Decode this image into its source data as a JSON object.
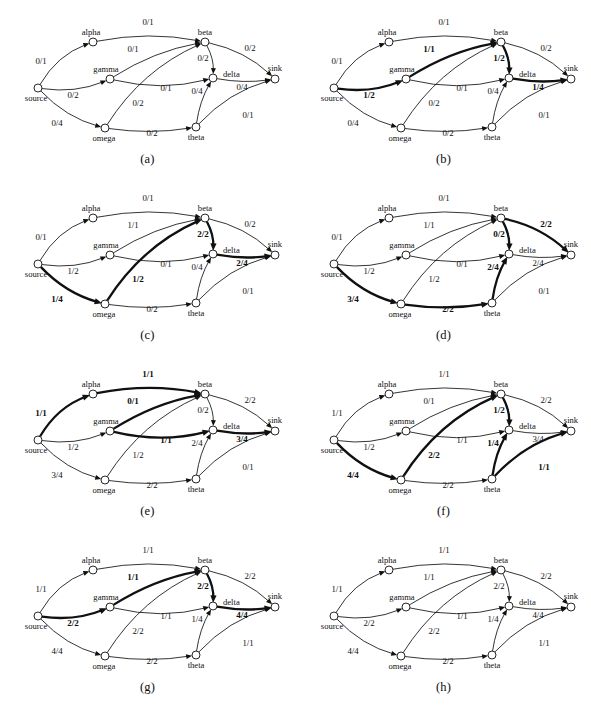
{
  "figure": {
    "kind": "max-flow-augmenting-path-sequence",
    "panel_count": 8
  },
  "nodes": [
    {
      "id": "source",
      "label": "source",
      "x": 38,
      "y": 88,
      "label_dx": -2,
      "label_dy": 13,
      "anchor": "middle"
    },
    {
      "id": "alpha",
      "label": "alpha",
      "x": 93,
      "y": 42,
      "label_dx": -2,
      "label_dy": -7,
      "anchor": "middle"
    },
    {
      "id": "gamma",
      "label": "gamma",
      "x": 110,
      "y": 79,
      "label_dx": -4,
      "label_dy": -7,
      "anchor": "middle"
    },
    {
      "id": "omega",
      "label": "omega",
      "x": 105,
      "y": 128,
      "label_dx": -1,
      "label_dy": 13,
      "anchor": "middle"
    },
    {
      "id": "beta",
      "label": "beta",
      "x": 205,
      "y": 42,
      "label_dx": 0,
      "label_dy": -7,
      "anchor": "middle"
    },
    {
      "id": "delta",
      "label": "delta",
      "x": 213,
      "y": 78,
      "label_dx": 10,
      "label_dy": -1,
      "anchor": "start"
    },
    {
      "id": "theta",
      "label": "theta",
      "x": 196,
      "y": 127,
      "label_dx": 0,
      "label_dy": 13,
      "anchor": "middle"
    },
    {
      "id": "sink",
      "label": "sink",
      "x": 275,
      "y": 79,
      "label_dx": 0,
      "label_dy": -8,
      "anchor": "middle"
    }
  ],
  "edges": [
    {
      "id": "source-alpha",
      "from": "source",
      "to": "alpha",
      "label_x": 41,
      "label_y": 64
    },
    {
      "id": "source-gamma",
      "from": "source",
      "to": "gamma",
      "label_x": 73,
      "label_y": 98
    },
    {
      "id": "source-omega",
      "from": "source",
      "to": "omega",
      "label_x": 57,
      "label_y": 126
    },
    {
      "id": "alpha-beta",
      "from": "alpha",
      "to": "beta",
      "label_x": 148,
      "label_y": 25
    },
    {
      "id": "gamma-beta",
      "from": "gamma",
      "to": "beta",
      "label_x": 133,
      "label_y": 52
    },
    {
      "id": "gamma-delta",
      "from": "gamma",
      "to": "delta",
      "label_x": 166,
      "label_y": 91
    },
    {
      "id": "omega-beta",
      "from": "omega",
      "to": "beta",
      "label_x": 138,
      "label_y": 106
    },
    {
      "id": "omega-theta",
      "from": "omega",
      "to": "theta",
      "label_x": 152,
      "label_y": 136
    },
    {
      "id": "beta-delta",
      "from": "beta",
      "to": "delta",
      "label_x": 203,
      "label_y": 61
    },
    {
      "id": "beta-sink",
      "from": "beta",
      "to": "sink",
      "label_x": 250,
      "label_y": 51
    },
    {
      "id": "theta-delta",
      "from": "theta",
      "to": "delta",
      "label_x": 197,
      "label_y": 94
    },
    {
      "id": "delta-sink",
      "from": "delta",
      "to": "sink",
      "label_x": 242,
      "label_y": 90
    },
    {
      "id": "theta-sink",
      "from": "theta",
      "to": "sink",
      "label_x": 248,
      "label_y": 118
    }
  ],
  "panels": [
    {
      "caption": "(a)",
      "flows": {
        "source-alpha": "0/1",
        "source-gamma": "0/2",
        "source-omega": "0/4",
        "alpha-beta": "0/1",
        "gamma-beta": "0/1",
        "gamma-delta": "0/1",
        "omega-beta": "0/2",
        "omega-theta": "0/2",
        "beta-delta": "0/2",
        "beta-sink": "0/2",
        "theta-delta": "0/4",
        "delta-sink": "0/4",
        "theta-sink": "0/1"
      },
      "bold": []
    },
    {
      "caption": "(b)",
      "flows": {
        "source-alpha": "0/1",
        "source-gamma": "1/2",
        "source-omega": "0/4",
        "alpha-beta": "0/1",
        "gamma-beta": "1/1",
        "gamma-delta": "0/1",
        "omega-beta": "0/2",
        "omega-theta": "0/2",
        "beta-delta": "1/2",
        "beta-sink": "0/2",
        "theta-delta": "0/4",
        "delta-sink": "1/4",
        "theta-sink": "0/1"
      },
      "bold": [
        "source-gamma",
        "gamma-beta",
        "beta-delta",
        "delta-sink"
      ]
    },
    {
      "caption": "(c)",
      "flows": {
        "source-alpha": "0/1",
        "source-gamma": "1/2",
        "source-omega": "1/4",
        "alpha-beta": "0/1",
        "gamma-beta": "1/1",
        "gamma-delta": "0/1",
        "omega-beta": "1/2",
        "omega-theta": "0/2",
        "beta-delta": "2/2",
        "beta-sink": "0/2",
        "theta-delta": "0/4",
        "delta-sink": "2/4",
        "theta-sink": "0/1"
      },
      "bold": [
        "source-omega",
        "omega-beta",
        "beta-delta",
        "delta-sink"
      ]
    },
    {
      "caption": "(d)",
      "flows": {
        "source-alpha": "0/1",
        "source-gamma": "1/2",
        "source-omega": "3/4",
        "alpha-beta": "0/1",
        "gamma-beta": "1/1",
        "gamma-delta": "0/1",
        "omega-beta": "1/2",
        "omega-theta": "2/2",
        "beta-delta": "0/2",
        "beta-sink": "2/2",
        "theta-delta": "2/4",
        "delta-sink": "2/4",
        "theta-sink": "0/1"
      },
      "bold": [
        "source-omega",
        "omega-theta",
        "theta-delta",
        "beta-delta",
        "beta-sink"
      ]
    },
    {
      "caption": "(e)",
      "flows": {
        "source-alpha": "1/1",
        "source-gamma": "1/2",
        "source-omega": "3/4",
        "alpha-beta": "1/1",
        "gamma-beta": "0/1",
        "gamma-delta": "1/1",
        "omega-beta": "1/2",
        "omega-theta": "2/2",
        "beta-delta": "0/2",
        "beta-sink": "2/2",
        "theta-delta": "2/4",
        "delta-sink": "3/4",
        "theta-sink": "0/1"
      },
      "bold": [
        "source-alpha",
        "alpha-beta",
        "gamma-beta",
        "gamma-delta",
        "delta-sink"
      ]
    },
    {
      "caption": "(f)",
      "flows": {
        "source-alpha": "1/1",
        "source-gamma": "1/2",
        "source-omega": "4/4",
        "alpha-beta": "1/1",
        "gamma-beta": "0/1",
        "gamma-delta": "1/1",
        "omega-beta": "2/2",
        "omega-theta": "2/2",
        "beta-delta": "1/2",
        "beta-sink": "2/2",
        "theta-delta": "1/4",
        "delta-sink": "3/4",
        "theta-sink": "1/1"
      },
      "bold": [
        "source-omega",
        "omega-beta",
        "beta-delta",
        "theta-delta",
        "theta-sink"
      ]
    },
    {
      "caption": "(g)",
      "flows": {
        "source-alpha": "1/1",
        "source-gamma": "2/2",
        "source-omega": "4/4",
        "alpha-beta": "1/1",
        "gamma-beta": "1/1",
        "gamma-delta": "1/1",
        "omega-beta": "2/2",
        "omega-theta": "2/2",
        "beta-delta": "2/2",
        "beta-sink": "2/2",
        "theta-delta": "1/4",
        "delta-sink": "4/4",
        "theta-sink": "1/1"
      },
      "bold": [
        "source-gamma",
        "gamma-beta",
        "beta-delta",
        "delta-sink"
      ]
    },
    {
      "caption": "(h)",
      "flows": {
        "source-alpha": "1/1",
        "source-gamma": "2/2",
        "source-omega": "4/4",
        "alpha-beta": "1/1",
        "gamma-beta": "1/1",
        "gamma-delta": "1/1",
        "omega-beta": "2/2",
        "omega-theta": "2/2",
        "beta-delta": "2/2",
        "beta-sink": "2/2",
        "theta-delta": "1/4",
        "delta-sink": "4/4",
        "theta-sink": "1/1"
      },
      "bold": []
    }
  ]
}
